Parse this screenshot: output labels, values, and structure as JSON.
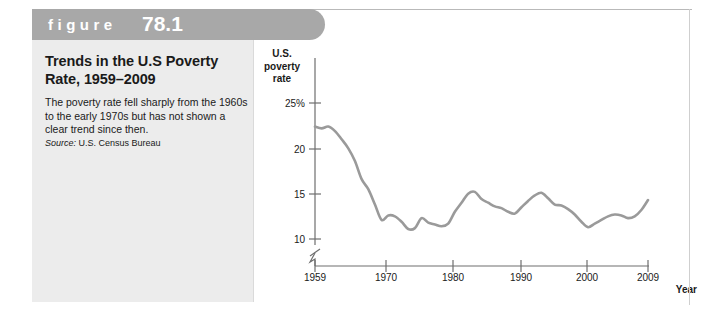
{
  "figure": {
    "header_label": "figure",
    "header_number": "78.1",
    "title": "Trends in the U.S Poverty Rate, 1959–2009",
    "body": "The poverty rate fell sharply from the 1960s to the early 1970s but has not shown a clear trend since then.",
    "source_word": "Source:",
    "source_text": " U.S. Census Bureau"
  },
  "colors": {
    "header_bar": "#a8a8a8",
    "caption_panel": "#ececec",
    "line": "#9a9a9a",
    "axis": "#6e6e6e",
    "text": "#1a1a1a"
  },
  "chart_data": {
    "type": "line",
    "title": "Trends in the U.S Poverty Rate, 1959–2009",
    "xlabel": "Year",
    "ylabel": "U.S. poverty rate",
    "ylabel_lines": [
      "U.S.",
      "poverty",
      "rate"
    ],
    "xlim": [
      1959,
      2009
    ],
    "ylim": [
      8.5,
      25
    ],
    "grid": false,
    "legend": false,
    "axis_break_y": true,
    "y_ticks": [
      25,
      20,
      15,
      10
    ],
    "y_tick_labels": [
      "25%",
      "20",
      "15",
      "10"
    ],
    "x_ticks": [
      1959,
      1970,
      1980,
      1990,
      2000,
      2009
    ],
    "x_tick_labels": [
      "1959",
      "1970",
      "1980",
      "1990",
      "2000",
      "2009"
    ],
    "series": [
      {
        "name": "U.S. poverty rate",
        "x": [
          1959,
          1960,
          1961,
          1962,
          1963,
          1964,
          1965,
          1966,
          1967,
          1968,
          1969,
          1970,
          1971,
          1972,
          1973,
          1974,
          1975,
          1976,
          1977,
          1978,
          1979,
          1980,
          1981,
          1982,
          1983,
          1984,
          1985,
          1986,
          1987,
          1988,
          1989,
          1990,
          1991,
          1992,
          1993,
          1994,
          1995,
          1996,
          1997,
          1998,
          1999,
          2000,
          2001,
          2002,
          2003,
          2004,
          2005,
          2006,
          2007,
          2008,
          2009
        ],
        "values": [
          22.4,
          22.2,
          22.4,
          21.9,
          21.0,
          20.0,
          18.6,
          16.6,
          15.5,
          13.8,
          12.1,
          12.6,
          12.5,
          11.9,
          11.1,
          11.2,
          12.3,
          11.8,
          11.6,
          11.4,
          11.7,
          13.0,
          14.0,
          15.0,
          15.2,
          14.4,
          14.0,
          13.6,
          13.4,
          13.0,
          12.8,
          13.5,
          14.2,
          14.8,
          15.1,
          14.5,
          13.8,
          13.7,
          13.3,
          12.7,
          11.9,
          11.3,
          11.7,
          12.1,
          12.5,
          12.7,
          12.6,
          12.3,
          12.5,
          13.2,
          14.3
        ]
      }
    ]
  }
}
